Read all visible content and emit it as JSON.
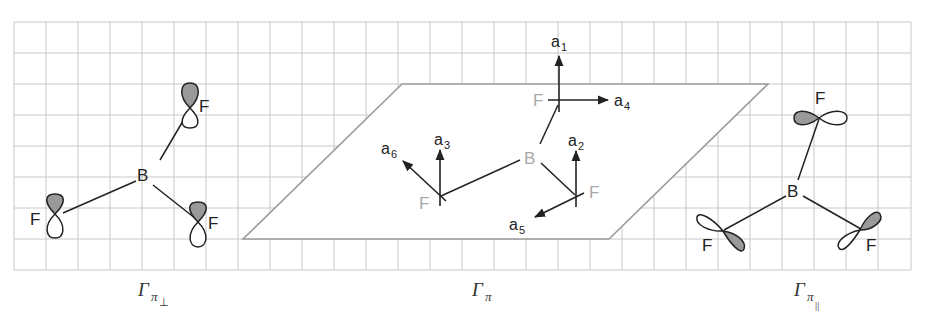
{
  "figure": {
    "grid": {
      "left": 14,
      "top": 22,
      "right": 911,
      "bottom": 270,
      "cell": 32,
      "color": "#c8c8c8"
    },
    "panels": [
      {
        "id": "pi-perp",
        "caption": {
          "symbol": "Γ",
          "sub": "π",
          "subsub": "⊥"
        },
        "atoms": {
          "center": "B",
          "ligands": [
            "F",
            "F",
            "F"
          ]
        },
        "orbital_type": "p-orbitals perpendicular to molecular plane"
      },
      {
        "id": "pi",
        "caption": {
          "symbol": "Γ",
          "sub": "π"
        },
        "atoms": {
          "center": "B",
          "ligands": [
            "F",
            "F",
            "F"
          ]
        },
        "vectors": [
          "a1",
          "a2",
          "a3",
          "a4",
          "a5",
          "a6"
        ],
        "vector_labels": {
          "a1": {
            "base": "a",
            "sub": "1"
          },
          "a2": {
            "base": "a",
            "sub": "2"
          },
          "a3": {
            "base": "a",
            "sub": "3"
          },
          "a4": {
            "base": "a",
            "sub": "4"
          },
          "a5": {
            "base": "a",
            "sub": "5"
          },
          "a6": {
            "base": "a",
            "sub": "6"
          }
        }
      },
      {
        "id": "pi-parallel",
        "caption": {
          "symbol": "Γ",
          "sub": "π",
          "subsub": "||"
        },
        "atoms": {
          "center": "B",
          "ligands": [
            "F",
            "F",
            "F"
          ]
        },
        "orbital_type": "p-orbitals in molecular plane"
      }
    ],
    "colors": {
      "shaded_lobe": "#9a9a9a",
      "plane_edge": "#9a9a9a",
      "grey_atom": "#a8a8a8",
      "ink": "#222222"
    }
  }
}
